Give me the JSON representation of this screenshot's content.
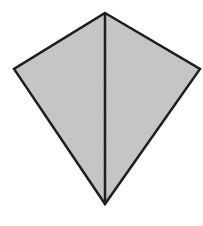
{
  "diagram": {
    "shape": "kite",
    "vertices": {
      "top": [
        105,
        13
      ],
      "left": [
        14,
        69
      ],
      "right": [
        200,
        69
      ],
      "bottom": [
        105,
        204
      ]
    },
    "diagonal": {
      "from": "top",
      "to": "bottom"
    },
    "colors": {
      "fill": "#c6c6c6",
      "stroke": "#1e1e1e",
      "background": "#ffffff"
    },
    "stroke_width": 2.5
  }
}
